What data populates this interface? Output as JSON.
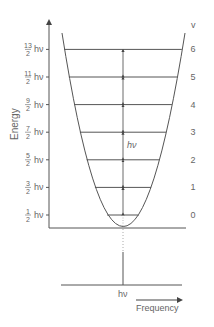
{
  "diagram": {
    "y_axis_label": "Energy",
    "quantum_number_label": "v",
    "levels": [
      {
        "v": "0",
        "num": "1",
        "den": "2",
        "unit": "hν"
      },
      {
        "v": "1",
        "num": "3",
        "den": "2",
        "unit": "hν"
      },
      {
        "v": "2",
        "num": "5",
        "den": "2",
        "unit": "hν"
      },
      {
        "v": "3",
        "num": "7",
        "den": "2",
        "unit": "hν"
      },
      {
        "v": "4",
        "num": "9",
        "den": "2",
        "unit": "hν"
      },
      {
        "v": "5",
        "num": "11",
        "den": "2",
        "unit": "hν"
      },
      {
        "v": "6",
        "num": "13",
        "den": "2",
        "unit": "hν"
      }
    ],
    "spacing_label": "hν",
    "spectrum": {
      "peak_label": "hν",
      "x_axis_label": "Frequency"
    },
    "colors": {
      "line": "#555555",
      "text": "#666666",
      "dotted": "#aaaaaa"
    }
  }
}
